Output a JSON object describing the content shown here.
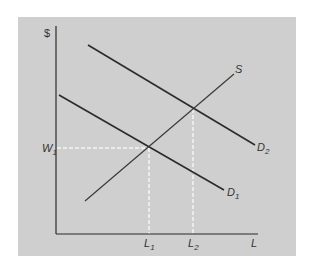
{
  "diagram": {
    "type": "supply-demand-labor-market",
    "axes": {
      "y_label": "$",
      "x_label": "L"
    },
    "curves": [
      {
        "name": "D1",
        "label": "D",
        "subscript": "1",
        "from": [
          59,
          95
        ],
        "to": [
          224,
          190
        ]
      },
      {
        "name": "D2",
        "label": "D",
        "subscript": "2",
        "from": [
          88,
          45
        ],
        "to": [
          255,
          145
        ]
      },
      {
        "name": "S",
        "label": "S",
        "subscript": "",
        "from": [
          85,
          201
        ],
        "to": [
          234,
          74
        ]
      }
    ],
    "equilibria": [
      {
        "name": "E1",
        "point": [
          149,
          148
        ]
      },
      {
        "name": "E2",
        "point": [
          193,
          109
        ]
      }
    ],
    "tick_labels": {
      "w1": {
        "label": "W",
        "subscript": "1"
      },
      "l1": {
        "label": "L",
        "subscript": "1"
      },
      "l2": {
        "label": "L",
        "subscript": "2"
      }
    },
    "colors": {
      "panel_bg": "#cfcfcf",
      "line": "#2b2b2b",
      "supply_line": "#3a3a3a",
      "dashed": "#f5f5f5",
      "text": "#333333"
    }
  }
}
